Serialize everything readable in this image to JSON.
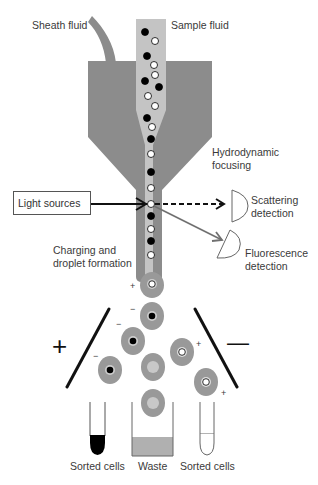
{
  "labels": {
    "sheath_fluid": "Sheath fluid",
    "sample_fluid": "Sample fluid",
    "hydrodynamic_line1": "Hydrodynamic",
    "hydrodynamic_line2": "focusing",
    "light_sources": "Light sources",
    "scattering_line1": "Scattering",
    "scattering_line2": "detection",
    "fluorescence_line1": "Fluorescence",
    "fluorescence_line2": "detection",
    "charging_line1": "Charging and",
    "charging_line2": "droplet formation",
    "plate_positive": "+",
    "plate_negative": "—",
    "tube_left": "Sorted cells",
    "waste": "Waste",
    "tube_right": "Sorted cells"
  },
  "charges": {
    "first_drop": "+",
    "left_drops": "−",
    "right_drops": "+"
  },
  "colors": {
    "sheath": "#8c8c8c",
    "sample": "#c4c4c4",
    "droplet": "#999999",
    "waste_fill": "#b0b0b0",
    "cell_dark": "#000000",
    "cell_light": "#ffffff",
    "line": "#111111",
    "fluor_arrow": "#707070"
  }
}
